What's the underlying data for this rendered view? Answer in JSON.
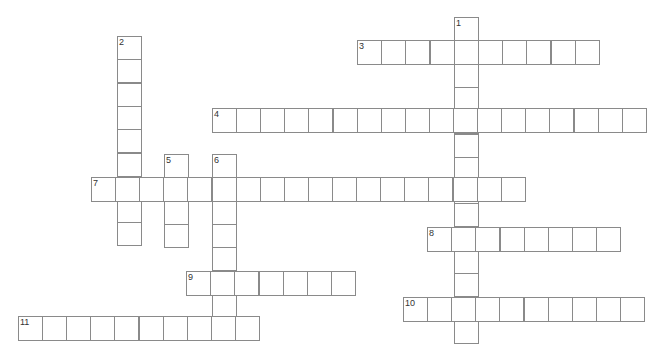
{
  "puzzle": {
    "type": "crossword",
    "cell_color": "#ffffff",
    "border_color": "#8a8a8a",
    "number_color": "#333333",
    "words": [
      {
        "number": "1",
        "direction": "down",
        "x": 454,
        "y": 17,
        "w": 24.2,
        "h": 23.3,
        "length": 14
      },
      {
        "number": "2",
        "direction": "down",
        "x": 117,
        "y": 36,
        "w": 24.2,
        "h": 23.3,
        "length": 9
      },
      {
        "number": "3",
        "direction": "across",
        "x": 357,
        "y": 40,
        "w": 24.2,
        "h": 24,
        "length": 10
      },
      {
        "number": "4",
        "direction": "across",
        "x": 212,
        "y": 108,
        "w": 24.1,
        "h": 24,
        "length": 18
      },
      {
        "number": "5",
        "direction": "down",
        "x": 164,
        "y": 154,
        "w": 24.2,
        "h": 23.3,
        "length": 4
      },
      {
        "number": "6",
        "direction": "down",
        "x": 212,
        "y": 154,
        "w": 24.2,
        "h": 23.3,
        "length": 8
      },
      {
        "number": "7",
        "direction": "across",
        "x": 91,
        "y": 177,
        "w": 24.1,
        "h": 24,
        "length": 18
      },
      {
        "number": "8",
        "direction": "across",
        "x": 427,
        "y": 227,
        "w": 24.2,
        "h": 24,
        "length": 8
      },
      {
        "number": "9",
        "direction": "across",
        "x": 186,
        "y": 271,
        "w": 24.2,
        "h": 24,
        "length": 7
      },
      {
        "number": "10",
        "direction": "across",
        "x": 403,
        "y": 297,
        "w": 24.1,
        "h": 24,
        "length": 10
      },
      {
        "number": "11",
        "direction": "across",
        "x": 18,
        "y": 316,
        "w": 24.1,
        "h": 24,
        "length": 10
      }
    ]
  }
}
